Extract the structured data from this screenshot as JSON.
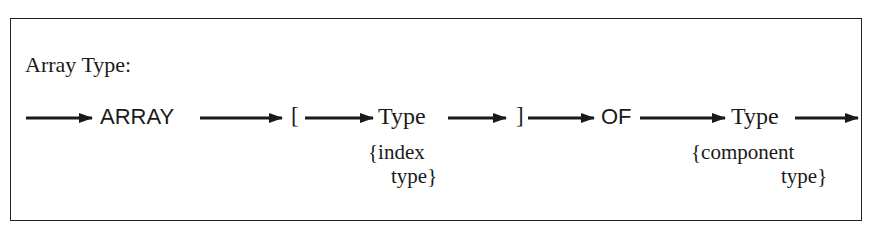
{
  "diagram": {
    "title": "Array Type:",
    "nodes": [
      {
        "id": "array-kw",
        "label": "ARRAY",
        "kind": "keyword"
      },
      {
        "id": "lbracket",
        "label": "[",
        "kind": "symbol"
      },
      {
        "id": "index-type",
        "label": "Type",
        "kind": "nonterminal",
        "note_line1": "{index",
        "note_line2": "type}"
      },
      {
        "id": "rbracket",
        "label": "]",
        "kind": "symbol"
      },
      {
        "id": "of-kw",
        "label": "OF",
        "kind": "keyword"
      },
      {
        "id": "component-type",
        "label": "Type",
        "kind": "nonterminal",
        "note_line1": "{component",
        "note_line2": "type}"
      }
    ],
    "edges": [
      {
        "from": "start",
        "to": "array-kw"
      },
      {
        "from": "array-kw",
        "to": "lbracket"
      },
      {
        "from": "lbracket",
        "to": "index-type"
      },
      {
        "from": "index-type",
        "to": "rbracket"
      },
      {
        "from": "rbracket",
        "to": "of-kw"
      },
      {
        "from": "of-kw",
        "to": "component-type"
      },
      {
        "from": "component-type",
        "to": "end"
      }
    ],
    "colors": {
      "ink": "#1a1a1a",
      "background": "#ffffff"
    }
  }
}
